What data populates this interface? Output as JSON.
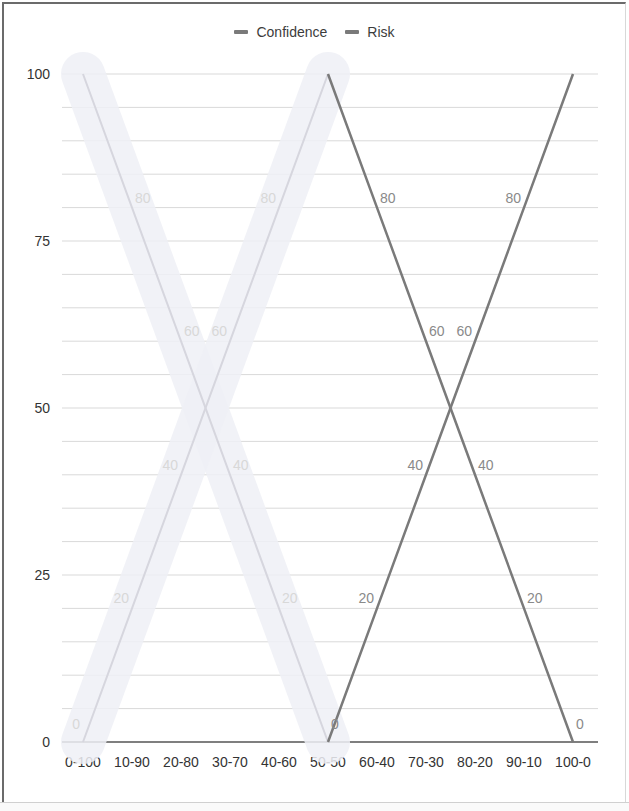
{
  "chart_data": {
    "type": "line",
    "title": "",
    "xlabel": "",
    "ylabel": "",
    "ylim": [
      0,
      100
    ],
    "yticks": [
      0,
      25,
      50,
      75,
      100
    ],
    "grid": true,
    "grid_step": 5,
    "legend_position": "top",
    "categories": [
      "0-100",
      "10-90",
      "20-80",
      "30-70",
      "40-60",
      "50-50",
      "60-40",
      "70-30",
      "80-20",
      "90-10",
      "100-0"
    ],
    "series": [
      {
        "name": "Confidence",
        "color": "#7a7a7a",
        "values": [
          100,
          80,
          60,
          40,
          20,
          0,
          20,
          40,
          60,
          80,
          100
        ]
      },
      {
        "name": "Risk",
        "color": "#7a7a7a",
        "values": [
          0,
          20,
          40,
          60,
          80,
          100,
          80,
          60,
          40,
          20,
          0
        ]
      }
    ],
    "data_labels": true,
    "annotations": [
      "Left half (0-100 to 50-50) appears faded/erased"
    ]
  },
  "legend": {
    "items": [
      {
        "label": "Confidence",
        "color": "#7a7a7a"
      },
      {
        "label": "Risk",
        "color": "#7a7a7a"
      }
    ]
  },
  "colors": {
    "line": "#7a7a7a",
    "faded_line": "#d6d6de",
    "faded_band": "#eef0f6",
    "grid": "#d9d9d9",
    "axis": "#555555",
    "tick_text": "#333333",
    "label_text": "#8a8a8a",
    "faded_label_text": "#d8d8d8"
  }
}
